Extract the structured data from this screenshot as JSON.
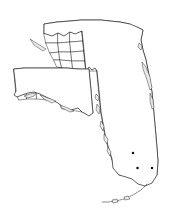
{
  "figure": {
    "title": "Florida county outline map",
    "background_color": "#ffffff",
    "width": 180,
    "height": 213,
    "boundary_color": "#3c3c3c",
    "outline_color": "#1a1a1a",
    "marker_color": "#111111"
  },
  "map": {
    "state_name": "Florida",
    "projection_note": "panhandle offset below peninsula",
    "region_labels": {
      "panhandle": "Panhandle",
      "peninsula": "Peninsula",
      "keys": "Florida Keys",
      "lake": "Lake Okeechobee"
    }
  },
  "markers": [
    {
      "name": "marker-1",
      "x": 133,
      "y": 153,
      "size": 2.2
    },
    {
      "name": "marker-2",
      "x": 137.5,
      "y": 168,
      "size": 2.2
    },
    {
      "name": "marker-3",
      "x": 152,
      "y": 168,
      "size": 2.2
    }
  ],
  "legend": {
    "visible": false,
    "items": []
  },
  "axes": {
    "visible": false
  }
}
